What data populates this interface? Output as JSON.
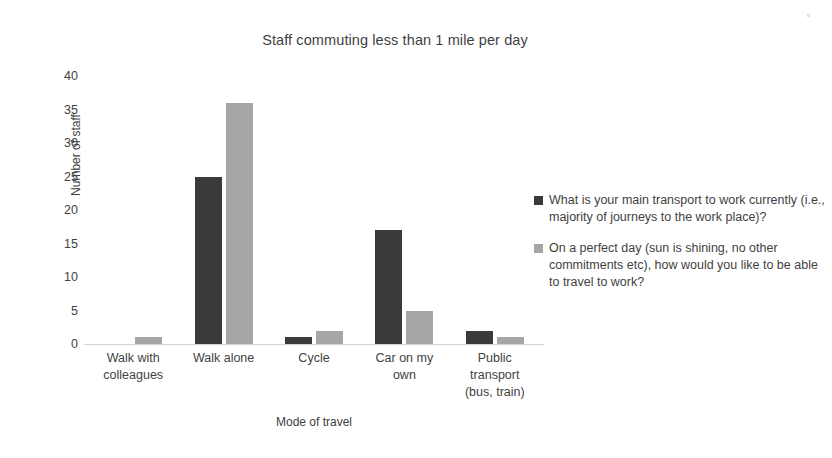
{
  "chart_data": {
    "type": "bar",
    "title": "Staff commuting less than 1 mile per day",
    "xlabel": "Mode of travel",
    "ylabel": "Number of staff",
    "ylim": [
      0,
      40
    ],
    "yticks": [
      0,
      5,
      10,
      15,
      20,
      25,
      30,
      35,
      40
    ],
    "grid": false,
    "legend_position": "right",
    "categories": [
      "Walk with colleagues",
      "Walk alone",
      "Cycle",
      "Car on my own",
      "Public transport (bus, train)"
    ],
    "category_lines": [
      [
        "Walk with",
        "colleagues"
      ],
      [
        "Walk alone"
      ],
      [
        "Cycle"
      ],
      [
        "Car on my",
        "own"
      ],
      [
        "Public",
        "transport",
        "(bus, train)"
      ]
    ],
    "series": [
      {
        "name": "What is your main transport to work currently (i.e., majority of journeys to the work place)?",
        "color": "#3a3a3a",
        "values": [
          0,
          25,
          1,
          17,
          2
        ]
      },
      {
        "name": "On a perfect day (sun is shining, no other commitments etc), how would you like to be able to travel to work?",
        "color": "#a6a6a6",
        "values": [
          1,
          36,
          2,
          5,
          1
        ]
      }
    ]
  },
  "colors": {
    "series_dark": "#3a3a3a",
    "series_light": "#a6a6a6",
    "axis_line": "#d4d4d4",
    "text": "#3f3f3f",
    "background": "#ffffff"
  }
}
